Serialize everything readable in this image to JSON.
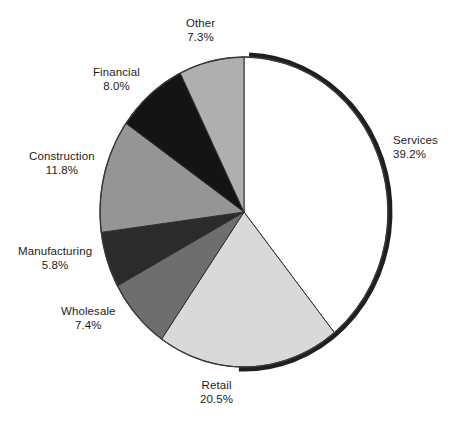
{
  "chart_data": {
    "type": "pie",
    "title": "",
    "subtitle": "",
    "xlabel": "",
    "ylabel": "",
    "legend_position": "none",
    "grid": false,
    "labels_show_percent": true,
    "start_angle_deg": 0,
    "direction": "clockwise",
    "categories": [
      "Services",
      "Retail",
      "Wholesale",
      "Manufacturing",
      "Construction",
      "Financial",
      "Other"
    ],
    "values": [
      39.2,
      20.5,
      7.4,
      5.8,
      11.8,
      8.0,
      7.3
    ],
    "value_labels": [
      "39.2%",
      "20.5%",
      "7.4%",
      "5.8%",
      "11.8%",
      "8.0%",
      "7.3%"
    ],
    "slice_colors": [
      "#ffffff",
      "#d9d9d9",
      "#6e6e6e",
      "#2b2b2b",
      "#959595",
      "#141414",
      "#afafaf"
    ],
    "slices": [
      {
        "name": "Services",
        "value": 39.2,
        "value_label": "39.2%",
        "color": "#ffffff",
        "label_align": "lbl-left",
        "label_x": 393,
        "label_y": 134
      },
      {
        "name": "Retail",
        "value": 20.5,
        "value_label": "20.5%",
        "color": "#d9d9d9",
        "label_align": "lbl-center",
        "label_x": 200,
        "label_y": 379
      },
      {
        "name": "Wholesale",
        "value": 7.4,
        "value_label": "7.4%",
        "color": "#6e6e6e",
        "label_align": "lbl-center",
        "label_x": 61,
        "label_y": 305
      },
      {
        "name": "Manufacturing",
        "value": 5.8,
        "value_label": "5.8%",
        "color": "#2b2b2b",
        "label_align": "lbl-center",
        "label_x": 18,
        "label_y": 245
      },
      {
        "name": "Construction",
        "value": 11.8,
        "value_label": "11.8%",
        "color": "#959595",
        "label_align": "lbl-center",
        "label_x": 29,
        "label_y": 150
      },
      {
        "name": "Financial",
        "value": 8.0,
        "value_label": "8.0%",
        "color": "#141414",
        "label_align": "lbl-center",
        "label_x": 93,
        "label_y": 66
      },
      {
        "name": "Other",
        "value": 7.3,
        "value_label": "7.3%",
        "color": "#afafaf",
        "label_align": "lbl-center",
        "label_x": 186,
        "label_y": 17
      }
    ],
    "geometry": {
      "center_x": 244,
      "center_y": 212,
      "radius_x": 144,
      "radius_y": 155,
      "rim_color": "#1f1f1f",
      "outline_color": "#3a3a3a"
    }
  }
}
